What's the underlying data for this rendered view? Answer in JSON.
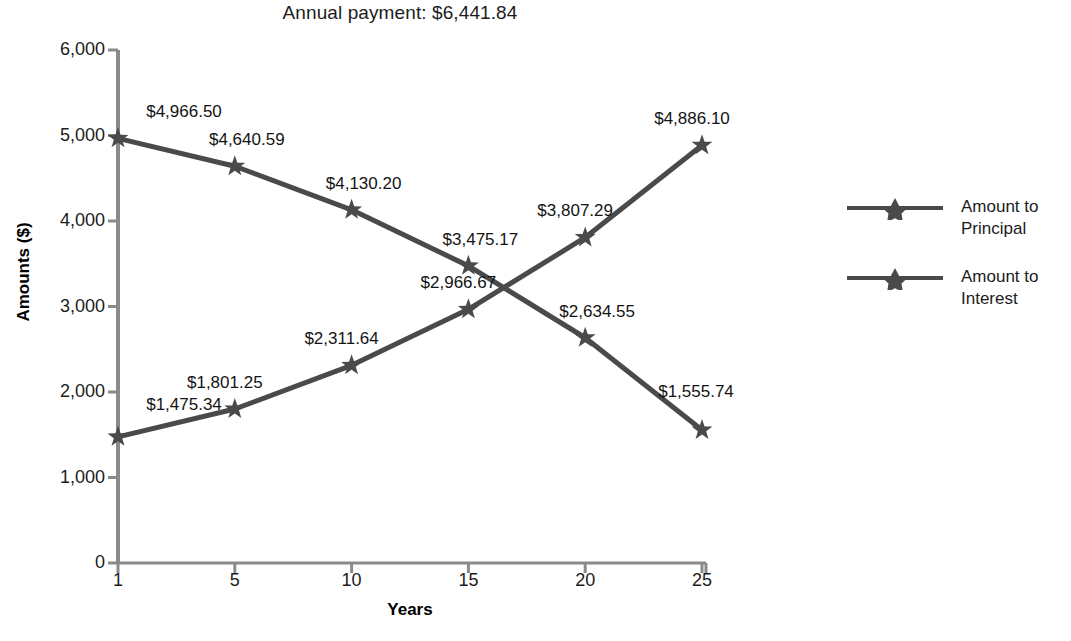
{
  "chart_data": {
    "type": "line",
    "title": "Annual payment: $6,441.84",
    "xlabel": "Years",
    "ylabel": "Amounts ($)",
    "categories": [
      "1",
      "5",
      "10",
      "15",
      "20",
      "25"
    ],
    "x": [
      1,
      5,
      10,
      15,
      20,
      25
    ],
    "ylim": [
      0,
      6000
    ],
    "ytick_labels": [
      "0",
      "1,000",
      "2,000",
      "3,000",
      "4,000",
      "5,000",
      "6,000"
    ],
    "ytick_values": [
      0,
      1000,
      2000,
      3000,
      4000,
      5000,
      6000
    ],
    "grid": false,
    "legend_position": "right",
    "series": [
      {
        "name": "Amount to Principal",
        "values": [
          1475.34,
          1801.25,
          2311.64,
          2966.67,
          3807.29,
          4886.1
        ],
        "labels": [
          "$1,475.34",
          "$1,801.25",
          "$2,311.64",
          "$2,966.67",
          "$3,807.29",
          "$4,886.10"
        ],
        "color": "#4a4a4a",
        "marker": "star"
      },
      {
        "name": "Amount to Interest",
        "values": [
          4966.5,
          4640.59,
          4130.2,
          3475.17,
          2634.55,
          1555.74
        ],
        "labels": [
          "$4,966.50",
          "$4,640.59",
          "$4,130.20",
          "$3,475.17",
          "$2,634.55",
          "$1,555.74"
        ],
        "color": "#4a4a4a",
        "marker": "star"
      }
    ]
  },
  "legend": {
    "items": [
      {
        "label": "Amount to Principal"
      },
      {
        "label": "Amount to Interest"
      }
    ]
  },
  "style": {
    "axis_color": "#8a8a8a",
    "line_color": "#4a4a4a",
    "text_color": "#1c1c1c",
    "background": "#ffffff"
  }
}
